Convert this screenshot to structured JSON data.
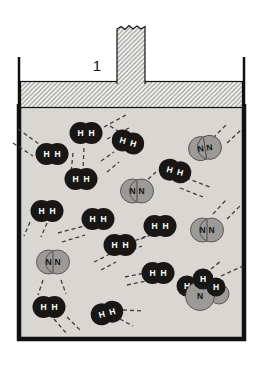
{
  "figure": {
    "label": "1"
  },
  "atoms": {
    "h": "H",
    "n": "N"
  },
  "colors": {
    "background": "#ffffff",
    "gas_bg": "#d8d7d2",
    "h2_fill": "#191715",
    "h2_text": "#ffffff",
    "n2_fill": "#9b9a97",
    "n2_stroke": "#44423f",
    "n2_text": "#121212",
    "outline": "#111111",
    "hatch_bg": "#f4f3f0",
    "hatch_line": "#8a8a8a",
    "dash_color": "#3f3e3b"
  },
  "molecules": [
    {
      "type": "h2",
      "x": 86,
      "y": 133,
      "rot": 0
    },
    {
      "type": "h2",
      "x": 128,
      "y": 142,
      "rot": 16
    },
    {
      "type": "h2",
      "x": 52,
      "y": 154,
      "rot": 0
    },
    {
      "type": "h2",
      "x": 81,
      "y": 179,
      "rot": 0
    },
    {
      "type": "h2",
      "x": 175,
      "y": 171,
      "rot": 14
    },
    {
      "type": "h2",
      "x": 47,
      "y": 211,
      "rot": 0
    },
    {
      "type": "h2",
      "x": 98,
      "y": 219,
      "rot": 0
    },
    {
      "type": "h2",
      "x": 160,
      "y": 226,
      "rot": 0
    },
    {
      "type": "h2",
      "x": 120,
      "y": 245,
      "rot": 0
    },
    {
      "type": "h2",
      "x": 158,
      "y": 273,
      "rot": 0
    },
    {
      "type": "h2",
      "x": 49,
      "y": 307,
      "rot": 0
    },
    {
      "type": "h2",
      "x": 107,
      "y": 313,
      "rot": -14
    },
    {
      "type": "n2",
      "x": 205,
      "y": 148,
      "rot": -8
    },
    {
      "type": "n2",
      "x": 137,
      "y": 191,
      "rot": 0
    },
    {
      "type": "n2",
      "x": 207,
      "y": 230,
      "rot": 0
    },
    {
      "type": "n2",
      "x": 53,
      "y": 262,
      "rot": 0
    }
  ],
  "cluster": {
    "circles": [
      {
        "cx": 187,
        "cy": 286,
        "r": 10.5,
        "kind": "h",
        "label": "H"
      },
      {
        "cx": 219,
        "cy": 294,
        "r": 10,
        "kind": "n",
        "label": ""
      },
      {
        "cx": 200,
        "cy": 296,
        "r": 14.5,
        "kind": "n",
        "label": "N"
      },
      {
        "cx": 203,
        "cy": 279,
        "r": 10.5,
        "kind": "h",
        "label": "H"
      },
      {
        "cx": 216,
        "cy": 287,
        "r": 9.5,
        "kind": "h",
        "label": "H"
      }
    ]
  },
  "motion_dashes": [
    [
      104,
      127,
      126,
      115
    ],
    [
      107,
      139,
      129,
      128
    ],
    [
      110,
      126,
      118,
      131
    ],
    [
      101,
      161,
      114,
      152
    ],
    [
      107,
      172,
      119,
      162
    ],
    [
      18,
      129,
      39,
      144
    ],
    [
      13,
      143,
      33,
      156
    ],
    [
      73,
      153,
      71,
      173
    ],
    [
      84,
      148,
      83,
      169
    ],
    [
      186,
      178,
      210,
      187
    ],
    [
      180,
      188,
      203,
      197
    ],
    [
      30,
      222,
      24,
      236
    ],
    [
      47,
      223,
      41,
      237
    ],
    [
      58,
      233,
      84,
      226
    ],
    [
      62,
      242,
      85,
      235
    ],
    [
      129,
      243,
      147,
      236
    ],
    [
      126,
      252,
      142,
      246
    ],
    [
      94,
      262,
      110,
      254
    ],
    [
      101,
      270,
      116,
      262
    ],
    [
      141,
      239,
      153,
      234
    ],
    [
      125,
      277,
      145,
      273
    ],
    [
      127,
      285,
      146,
      281
    ],
    [
      54,
      319,
      67,
      334
    ],
    [
      67,
      317,
      81,
      331
    ],
    [
      123,
      310,
      144,
      311
    ],
    [
      120,
      319,
      133,
      326
    ],
    [
      213,
      138,
      226,
      125
    ],
    [
      227,
      143,
      241,
      130
    ],
    [
      143,
      184,
      156,
      172
    ],
    [
      213,
      214,
      226,
      200
    ],
    [
      227,
      219,
      240,
      206
    ],
    [
      43,
      280,
      38,
      295
    ],
    [
      61,
      280,
      66,
      294
    ],
    [
      211,
      269,
      221,
      261
    ],
    [
      221,
      276,
      243,
      266
    ]
  ]
}
